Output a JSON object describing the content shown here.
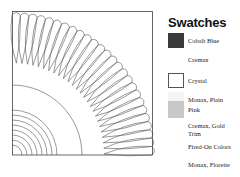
{
  "legend": {
    "title": "Swatches",
    "items": [
      {
        "label": "Cobalt Blue",
        "swatch": "#3a3a3a",
        "border": "#3a3a3a",
        "has_swatch": true
      },
      {
        "label": "Cremax",
        "swatch": "#fdfdfd",
        "border": "#fdfdfd",
        "has_swatch": false
      },
      {
        "label": "Crystal",
        "swatch": "#ffffff",
        "border": "#555555",
        "has_swatch": true
      },
      {
        "label": "Monax, Plain",
        "swatch": "#f4f4f4",
        "border": "#f4f4f4",
        "has_swatch": true
      },
      {
        "label": "Pink",
        "swatch": "#c8c8c8",
        "border": "#c8c8c8",
        "has_swatch": true
      },
      {
        "label": "Cremax, Gold Trim",
        "swatch": "#fdfdfd",
        "border": "#fdfdfd",
        "has_swatch": false
      },
      {
        "label": "Fired-On Colors",
        "swatch": "#fdfdfd",
        "border": "#fdfdfd",
        "has_swatch": false
      },
      {
        "label": "Monax, Florette",
        "swatch": "#fdfdfd",
        "border": "#fdfdfd",
        "has_swatch": false
      }
    ]
  },
  "diagram": {
    "line_color": "#555555",
    "frame_color": "#444444"
  }
}
